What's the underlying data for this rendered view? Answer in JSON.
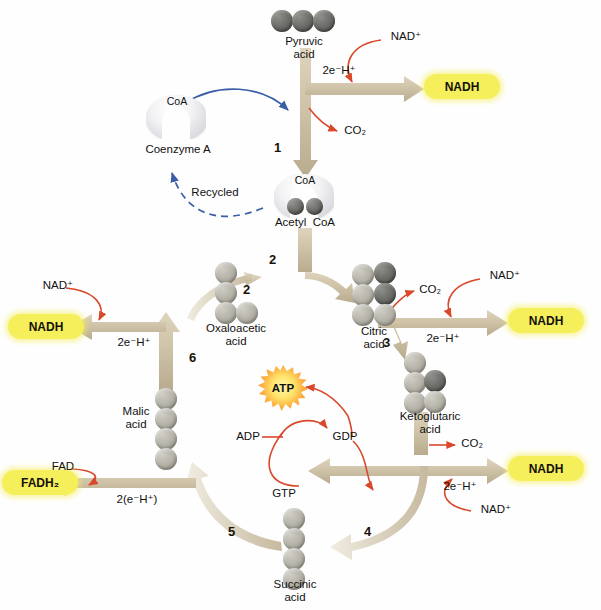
{
  "diagram": {
    "colors": {
      "product_capsule": "#f6ef5c",
      "arrow_tan": "#cfc3a8",
      "arrow_tail_light": "#e8e2d2",
      "red_arrow": "#d9482b",
      "blue_arrow": "#3b5ea8",
      "ball_light": "#b8b6ab",
      "ball_dark": "#6f6f6b",
      "atp_orange": "#f08a22"
    }
  },
  "molecules": {
    "pyruvic_acid": {
      "label": "Pyruvic\nacid",
      "carbons": 3,
      "ball_colors": [
        "dark",
        "dark",
        "dark"
      ]
    },
    "coenzyme_a": {
      "label": "Coenzyme A",
      "badge": "CoA"
    },
    "acetyl_coa": {
      "label": "Acetyl  CoA",
      "badge": "CoA",
      "ball_colors": [
        "dark",
        "dark"
      ]
    },
    "oxaloacetic_acid": {
      "label": "Oxaloacetic\nacid",
      "carbons": 4,
      "ball_colors": [
        "light",
        "light",
        "light",
        "light"
      ]
    },
    "citric_acid": {
      "label": "Citric\nacid",
      "carbons": 6,
      "ball_colors": [
        "light",
        "dark",
        "light",
        "dark",
        "light",
        "light"
      ]
    },
    "ketoglutaric_acid": {
      "label": "Ketoglutaric\nacid",
      "carbons": 5,
      "ball_colors": [
        "light",
        "light",
        "dark",
        "light",
        "light"
      ]
    },
    "succinic_acid": {
      "label": "Succinic\nacid",
      "carbons": 4,
      "ball_colors": [
        "light",
        "light",
        "light",
        "light"
      ]
    },
    "malic_acid": {
      "label": "Malic\nacid",
      "carbons": 4,
      "ball_colors": [
        "light",
        "light",
        "light",
        "light"
      ]
    }
  },
  "products": {
    "nadh_top": "NADH",
    "nadh_right_upper": "NADH",
    "nadh_right_lower": "NADH",
    "nadh_left": "NADH",
    "fadh2": "FADH₂",
    "atp": "ATP"
  },
  "reactants": {
    "nad_top": "NAD⁺",
    "nad_right_upper": "NAD⁺",
    "nad_right_lower": "NAD⁺",
    "nad_left": "NAD⁺",
    "fad": "FAD",
    "adp": "ADP",
    "gdp": "GDP",
    "gtp": "GTP"
  },
  "byproducts": {
    "co2_step1": "CO₂",
    "co2_step3": "CO₂",
    "co2_step4": "CO₂"
  },
  "electron_labels": {
    "top": "2e⁻H⁺",
    "right_upper": "2e⁻H⁺",
    "right_lower": "2e⁻H⁺",
    "left": "2e⁻H⁺",
    "fadh2": "2(e⁻H⁺)"
  },
  "annotations": {
    "recycled": "Recycled"
  },
  "steps": [
    {
      "number": "1",
      "x": 274,
      "y": 140
    },
    {
      "number": "2",
      "x": 269,
      "y": 258
    },
    {
      "number": "2b",
      "label": "2",
      "x": 249,
      "y": 283
    },
    {
      "number": "3",
      "x": 382,
      "y": 341
    },
    {
      "number": "4",
      "x": 364,
      "y": 531
    },
    {
      "number": "5",
      "x": 229,
      "y": 531
    },
    {
      "number": "6",
      "x": 190,
      "y": 356
    }
  ]
}
